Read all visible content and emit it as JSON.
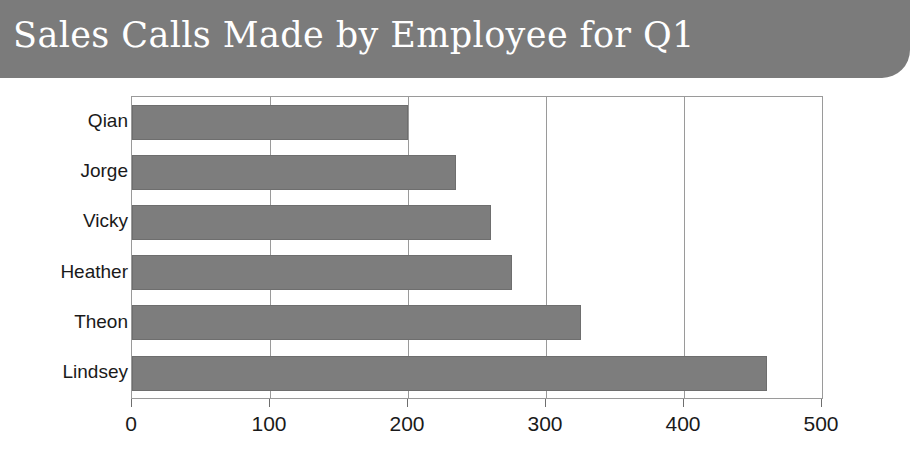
{
  "banner": {
    "title": "Sales Calls Made by Employee for Q1",
    "background_color": "#7b7b7b",
    "text_color": "#ffffff"
  },
  "chart_data": {
    "type": "bar",
    "orientation": "horizontal",
    "title": "Sales Calls Made by Employee for Q1",
    "xlabel": "",
    "ylabel": "",
    "categories": [
      "Qian",
      "Jorge",
      "Vicky",
      "Heather",
      "Theon",
      "Lindsey"
    ],
    "values": [
      200,
      235,
      260,
      275,
      325,
      460
    ],
    "xlim": [
      0,
      500
    ],
    "xticks": [
      0,
      100,
      200,
      300,
      400,
      500
    ],
    "xtick_labels": [
      "0",
      "100",
      "200",
      "300",
      "400",
      "500"
    ],
    "grid": "vertical",
    "legend": "none",
    "series": [
      {
        "name": "Sales Calls",
        "values": [
          200,
          235,
          260,
          275,
          325,
          460
        ],
        "color": "#7d7d7d"
      }
    ],
    "bar_color": "#7d7d7d",
    "gridline_color": "#9a9a9a",
    "plot_background": "#ffffff"
  }
}
